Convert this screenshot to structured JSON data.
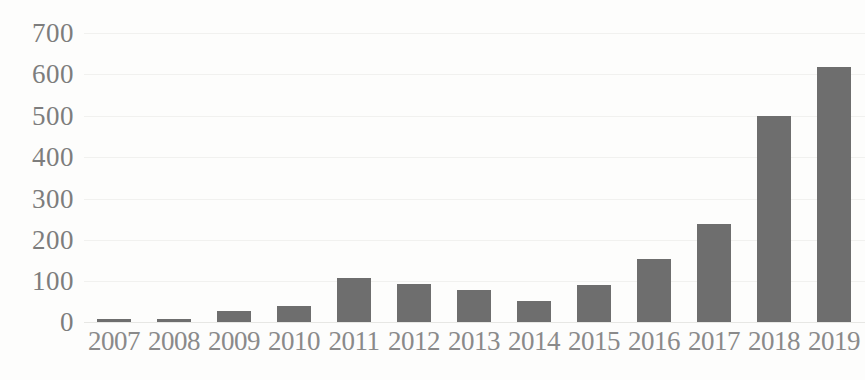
{
  "chart_data": {
    "type": "bar",
    "title": "",
    "subtitle": "",
    "xlabel": "",
    "ylabel": "",
    "categories": [
      "2007",
      "2008",
      "2009",
      "2010",
      "2011",
      "2012",
      "2013",
      "2014",
      "2015",
      "2016",
      "2017",
      "2018",
      "2019"
    ],
    "values": [
      8,
      8,
      27,
      38,
      107,
      92,
      78,
      51,
      90,
      153,
      238,
      500,
      617
    ],
    "series": [
      {
        "name": "",
        "values": [
          8,
          8,
          27,
          38,
          107,
          92,
          78,
          51,
          90,
          153,
          238,
          500,
          617
        ]
      }
    ],
    "ylim": [
      0,
      700
    ],
    "yticks": [
      0,
      100,
      200,
      300,
      400,
      500,
      600,
      700
    ],
    "ytick_labels": [
      "0",
      "100",
      "200",
      "300",
      "400",
      "500",
      "600",
      "700"
    ],
    "grid": true,
    "grid_axis": "y",
    "legend": false,
    "legend_position": "none",
    "annotations": [],
    "bar_color": "#6e6e6e",
    "gridline_color": "#f1f1ef",
    "axis_text_color": "#8a8a8a",
    "background_color": "#fdfdfc"
  }
}
